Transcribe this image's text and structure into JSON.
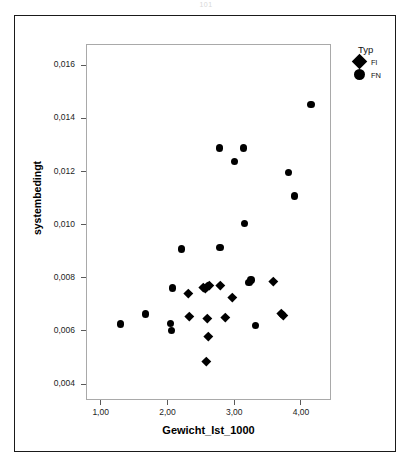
{
  "page": {
    "artifact_label": "101"
  },
  "chart_data": {
    "type": "scatter",
    "title": "",
    "xlabel": "Gewicht_Ist_1000",
    "ylabel": "systembedingt",
    "xlim": [
      0.78,
      4.45
    ],
    "ylim": [
      0.0034,
      0.0168
    ],
    "grid": false,
    "legend": {
      "title": "Typ",
      "position": "top-right",
      "entries": [
        {
          "name": "Fl",
          "marker": "diamond",
          "color": "#000000"
        },
        {
          "name": "FN",
          "marker": "circle",
          "color": "#000000"
        }
      ]
    },
    "x_ticks": [
      1.0,
      2.0,
      3.0,
      4.0
    ],
    "x_tick_labels": [
      "1,00",
      "2,00",
      "3,00",
      "4,00"
    ],
    "y_ticks": [
      0.004,
      0.006,
      0.008,
      0.01,
      0.012,
      0.014,
      0.016
    ],
    "y_tick_labels": [
      "0,004",
      "0,006",
      "0,008",
      "0,010",
      "0,012",
      "0,014",
      "0,016"
    ],
    "series": [
      {
        "name": "FN",
        "marker": "circle",
        "color": "#000000",
        "points": [
          {
            "x": 4.15,
            "y": 0.01452
          },
          {
            "x": 2.78,
            "y": 0.01288
          },
          {
            "x": 3.14,
            "y": 0.01288
          },
          {
            "x": 3.0,
            "y": 0.01238
          },
          {
            "x": 3.81,
            "y": 0.01197
          },
          {
            "x": 3.9,
            "y": 0.01108
          },
          {
            "x": 3.15,
            "y": 0.01005
          },
          {
            "x": 2.21,
            "y": 0.00908
          },
          {
            "x": 2.79,
            "y": 0.00915
          },
          {
            "x": 2.08,
            "y": 0.00761
          },
          {
            "x": 3.25,
            "y": 0.00792
          },
          {
            "x": 3.22,
            "y": 0.00783
          },
          {
            "x": 1.3,
            "y": 0.00626
          },
          {
            "x": 1.67,
            "y": 0.00664
          },
          {
            "x": 2.05,
            "y": 0.00628
          },
          {
            "x": 2.06,
            "y": 0.00601
          },
          {
            "x": 3.32,
            "y": 0.00621
          }
        ]
      },
      {
        "name": "Fl",
        "marker": "diamond",
        "color": "#000000",
        "points": [
          {
            "x": 2.54,
            "y": 0.00766
          },
          {
            "x": 2.57,
            "y": 0.00762
          },
          {
            "x": 2.6,
            "y": 0.00768
          },
          {
            "x": 2.63,
            "y": 0.00772
          },
          {
            "x": 2.79,
            "y": 0.00773
          },
          {
            "x": 2.32,
            "y": 0.00741
          },
          {
            "x": 2.97,
            "y": 0.00727
          },
          {
            "x": 3.58,
            "y": 0.00785
          },
          {
            "x": 2.33,
            "y": 0.00654
          },
          {
            "x": 2.6,
            "y": 0.00647
          },
          {
            "x": 2.87,
            "y": 0.00653
          },
          {
            "x": 3.71,
            "y": 0.00666
          },
          {
            "x": 3.74,
            "y": 0.00658
          },
          {
            "x": 2.61,
            "y": 0.00578
          },
          {
            "x": 2.58,
            "y": 0.00487
          }
        ]
      }
    ]
  }
}
